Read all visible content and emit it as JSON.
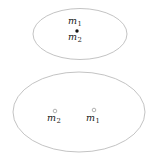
{
  "figure": {
    "background_color": "#ffffff",
    "stroke_color": "#b9b9b9",
    "text_color": "#1a1a1a",
    "point_filled_color": "#111111",
    "point_hollow_stroke": "#9a9a9a"
  },
  "top_region": {
    "shape": "ellipse",
    "labels": {
      "m1": "m",
      "m1_sub": "1",
      "m2": "m",
      "m2_sub": "2"
    },
    "point": {
      "style": "filled",
      "x": 77,
      "y": 31
    }
  },
  "bottom_region": {
    "shape": "ellipse",
    "labels": {
      "m2": "m",
      "m2_sub": "2",
      "m1": "m",
      "m1_sub": "1"
    },
    "points": [
      {
        "style": "hollow",
        "label": "m2",
        "x": 55,
        "y": 111
      },
      {
        "style": "hollow",
        "label": "m1",
        "x": 94,
        "y": 110
      }
    ]
  }
}
